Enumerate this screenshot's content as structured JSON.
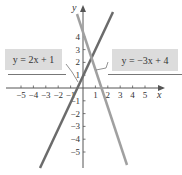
{
  "chart_data": {
    "type": "line",
    "title": "",
    "xlabel": "x",
    "ylabel": "y",
    "xlim": [
      -6,
      7
    ],
    "ylim": [
      -6,
      6
    ],
    "x_ticks": [
      -5,
      -4,
      -3,
      -2,
      -1,
      1,
      2,
      3,
      4,
      5
    ],
    "y_ticks": [
      -5,
      -4,
      -3,
      -2,
      -1,
      1,
      2,
      3,
      4
    ],
    "grid": false,
    "series": [
      {
        "name": "y = 2x + 1",
        "slope": 2,
        "intercept": 1,
        "color": "#6b6b6b",
        "x": [
          -3.5,
          2.3
        ],
        "y": [
          -6,
          5.6
        ]
      },
      {
        "name": "y = -3x + 4",
        "slope": -3,
        "intercept": 4,
        "color": "#9c9c9c",
        "x": [
          -0.6,
          3.3
        ],
        "y": [
          5.8,
          -5.9
        ]
      }
    ],
    "annotations": [
      {
        "text": "y = 2x + 1",
        "position": "left",
        "points_to": "y = 2x + 1"
      },
      {
        "text": "y = −3x + 4",
        "position": "right",
        "points_to": "y = -3x + 4"
      }
    ],
    "intersection": [
      0.6,
      2.2
    ]
  },
  "labels": {
    "left_eq": "y = 2x + 1",
    "right_eq": "y = −3x + 4",
    "x_axis": "x",
    "y_axis": "y"
  }
}
